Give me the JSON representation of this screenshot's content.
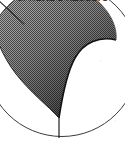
{
  "figure": {
    "caption": {
      "text": "SPHERE 2 RESULTS",
      "clipped": true,
      "position": "top-edge"
    },
    "background_color": "#ffffff",
    "ink_color": "#1a1a1a",
    "outline_color": "#3a3a3a",
    "canvas": {
      "width": 125,
      "height": 143
    },
    "elements": {
      "circle": {
        "label": "sphere-outline",
        "center_x": 62,
        "center_y": 60,
        "radius": 77,
        "stroke_width": 1,
        "fill": "none"
      },
      "shaded_lobe": {
        "label": "shaded-region",
        "pattern": "halftone-dither",
        "gradient_light": "#b0b0b0",
        "gradient_dark": "#151515",
        "gradient_direction": "top-left to bottom-right",
        "description": "teardrop lobe filling the upper portion of the disk, tapering to a point at bottom center"
      },
      "leader_line": {
        "label": "leader-line",
        "x1": 0,
        "y1": 2,
        "x2": 24,
        "y2": 24,
        "stroke_width": 1
      },
      "radius_line": {
        "label": "vertical-radius-line",
        "x1": 59,
        "y1": 117,
        "x2": 59,
        "y2": 138,
        "stroke_width": 1
      }
    }
  }
}
